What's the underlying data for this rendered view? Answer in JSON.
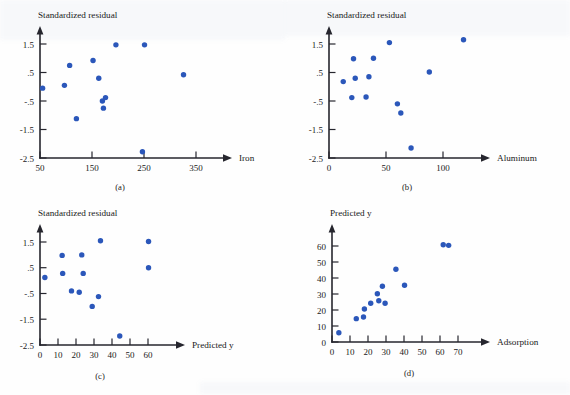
{
  "figure": {
    "background_color": "#fefefe",
    "point_color": "#2b57ba",
    "axis_color": "#26262e"
  },
  "panels": [
    {
      "key": "a",
      "caption": "(a)"
    },
    {
      "key": "b",
      "caption": "(b)"
    },
    {
      "key": "c",
      "caption": "(c)"
    },
    {
      "key": "d",
      "caption": "(d)"
    }
  ],
  "chart_data": [
    {
      "type": "scatter",
      "panel": "(a)",
      "title": "",
      "ylabel": "Standardized residual",
      "xlabel": "Iron",
      "xlim": [
        50,
        390
      ],
      "ylim": [
        -2.5,
        2.1
      ],
      "xticks": [
        50,
        150,
        250,
        350
      ],
      "xticklabels": [
        "50",
        "150",
        "250",
        "350"
      ],
      "yticks": [
        -2.5,
        -1.5,
        -0.5,
        0.5,
        1.5
      ],
      "yticklabels": [
        "-2.5",
        "-1.5",
        "-.5",
        ".5",
        "1.5"
      ],
      "grid": false,
      "legend": "none",
      "points": [
        {
          "x": 55,
          "y": -0.05
        },
        {
          "x": 97,
          "y": 0.05
        },
        {
          "x": 107,
          "y": 0.75
        },
        {
          "x": 120,
          "y": -1.12
        },
        {
          "x": 152,
          "y": 0.92
        },
        {
          "x": 163,
          "y": 0.3
        },
        {
          "x": 170,
          "y": -0.5
        },
        {
          "x": 172,
          "y": -0.75
        },
        {
          "x": 176,
          "y": -0.38
        },
        {
          "x": 196,
          "y": 1.47
        },
        {
          "x": 247,
          "y": -2.28
        },
        {
          "x": 251,
          "y": 1.47
        },
        {
          "x": 326,
          "y": 0.42
        }
      ]
    },
    {
      "type": "scatter",
      "panel": "(b)",
      "title": "",
      "ylabel": "Standardized residual",
      "xlabel": "Aluminum",
      "xlim": [
        0,
        131
      ],
      "ylim": [
        -2.5,
        2.1
      ],
      "xticks": [
        0,
        50,
        100
      ],
      "xticklabels": [
        "0",
        "50",
        "100"
      ],
      "yticks": [
        -2.5,
        -1.5,
        -0.5,
        0.5,
        1.5
      ],
      "yticklabels": [
        "-2.5",
        "-1.5",
        "-.5",
        ".5",
        "1.5"
      ],
      "grid": false,
      "legend": "none",
      "points": [
        {
          "x": 12.5,
          "y": 0.18
        },
        {
          "x": 20,
          "y": -0.38
        },
        {
          "x": 21.5,
          "y": 0.98
        },
        {
          "x": 23,
          "y": 0.3
        },
        {
          "x": 32.5,
          "y": -0.36
        },
        {
          "x": 35,
          "y": 0.35
        },
        {
          "x": 39,
          "y": 1.0
        },
        {
          "x": 53,
          "y": 1.55
        },
        {
          "x": 60,
          "y": -0.6
        },
        {
          "x": 63,
          "y": -0.92
        },
        {
          "x": 72,
          "y": -2.15
        },
        {
          "x": 88,
          "y": 0.52
        },
        {
          "x": 118,
          "y": 1.65
        }
      ]
    },
    {
      "type": "scatter",
      "panel": "(c)",
      "title": "",
      "ylabel": "Standardized residual",
      "xlabel": "Predicted y",
      "xlim": [
        0,
        78
      ],
      "ylim": [
        -2.5,
        2.1
      ],
      "xticks": [
        0,
        10,
        20,
        30,
        40,
        50,
        60
      ],
      "xticklabels": [
        "0",
        "10",
        "20",
        "30",
        "40",
        "50",
        "60"
      ],
      "yticks": [
        -2.5,
        -1.5,
        -0.5,
        0.5,
        1.5
      ],
      "yticklabels": [
        "-2.5",
        "-1.5",
        "-.5",
        ".5",
        "1.5"
      ],
      "grid": false,
      "legend": "none",
      "points": [
        {
          "x": 2.7,
          "y": 0.12
        },
        {
          "x": 12.3,
          "y": 0.98
        },
        {
          "x": 12.6,
          "y": 0.28
        },
        {
          "x": 17.5,
          "y": -0.4
        },
        {
          "x": 21.8,
          "y": -0.45
        },
        {
          "x": 23.2,
          "y": 1.0
        },
        {
          "x": 24.0,
          "y": 0.28
        },
        {
          "x": 29.0,
          "y": -1.0
        },
        {
          "x": 32.5,
          "y": -0.62
        },
        {
          "x": 33.6,
          "y": 1.55
        },
        {
          "x": 44.3,
          "y": -2.15
        },
        {
          "x": 60.3,
          "y": 1.52
        },
        {
          "x": 60.3,
          "y": 0.5
        }
      ]
    },
    {
      "type": "scatter",
      "panel": "(d)",
      "title": "",
      "ylabel": "Predicted y",
      "xlabel": "Adsorption",
      "xlim": [
        0,
        90
      ],
      "ylim": [
        0,
        70
      ],
      "xticks": [
        0,
        10,
        20,
        30,
        40,
        50,
        60,
        70
      ],
      "xticklabels": [
        "0",
        "10",
        "20",
        "30",
        "40",
        "50",
        "60",
        "70"
      ],
      "yticks": [
        0,
        10,
        20,
        30,
        40,
        50,
        60
      ],
      "yticklabels": [
        "0",
        "10",
        "20",
        "30",
        "40",
        "50",
        "60"
      ],
      "grid": false,
      "legend": "none",
      "points": [
        {
          "x": 3.8,
          "y": 5.8
        },
        {
          "x": 13.5,
          "y": 14.6
        },
        {
          "x": 17.5,
          "y": 15.6
        },
        {
          "x": 18.0,
          "y": 20.6
        },
        {
          "x": 21.5,
          "y": 24.2
        },
        {
          "x": 25.2,
          "y": 30.2
        },
        {
          "x": 26.0,
          "y": 25.8
        },
        {
          "x": 28.0,
          "y": 34.8
        },
        {
          "x": 29.5,
          "y": 24.2
        },
        {
          "x": 35.5,
          "y": 45.5
        },
        {
          "x": 40.3,
          "y": 35.5
        },
        {
          "x": 61.8,
          "y": 60.8
        },
        {
          "x": 64.8,
          "y": 60.4
        }
      ]
    }
  ]
}
